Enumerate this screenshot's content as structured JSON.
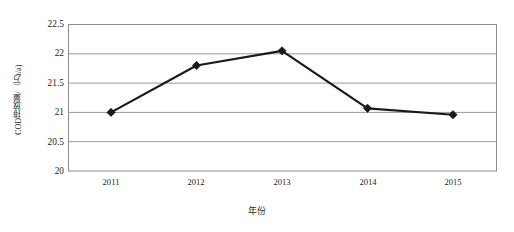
{
  "chart_data": {
    "type": "line",
    "title": "",
    "xlabel": "年份",
    "ylabel": "COD排放量/（万t/a)",
    "categories": [
      "2011",
      "2012",
      "2013",
      "2014",
      "2015"
    ],
    "values": [
      21.0,
      21.8,
      22.05,
      21.07,
      20.96
    ],
    "series": [
      {
        "name": "COD排放量",
        "values": [
          21.0,
          21.8,
          22.05,
          21.07,
          20.96
        ]
      }
    ],
    "ylim": [
      20,
      22.5
    ],
    "yticks": [
      "20",
      "20.5",
      "21",
      "21.5",
      "22",
      "22.5"
    ],
    "ytick_values": [
      20,
      20.5,
      21,
      21.5,
      22,
      22.5
    ],
    "xticks": [
      "2011",
      "2012",
      "2013",
      "2014",
      "2015"
    ],
    "grid": "horizontal",
    "legend": "none",
    "line_color": "#1a1a1a",
    "marker": "diamond",
    "grid_color": "#9a9a9a",
    "frame_color": "#8c8c8c",
    "background": "#ffffff"
  }
}
